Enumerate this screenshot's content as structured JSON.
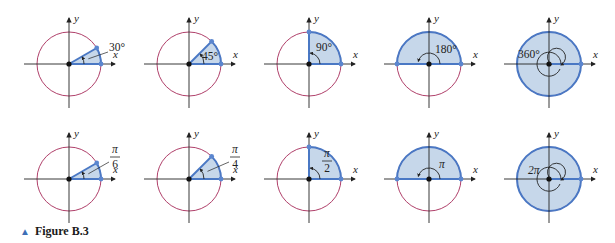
{
  "figure": {
    "caption_marker": "▲",
    "caption": "Figure B.3",
    "colors": {
      "circle": "#b0406a",
      "axis": "#222222",
      "ray": "#4a78c4",
      "fill": "#c6d7ea",
      "point": "#5b86cf",
      "label": "#222222"
    },
    "axis_labels": {
      "x": "x",
      "y": "y"
    },
    "rows": [
      {
        "unit": "degrees",
        "panels": [
          {
            "angle_deg": 30,
            "label": "30°"
          },
          {
            "angle_deg": 45,
            "label": "45°"
          },
          {
            "angle_deg": 90,
            "label": "90°"
          },
          {
            "angle_deg": 180,
            "label": "180°"
          },
          {
            "angle_deg": 360,
            "label": "360°"
          }
        ]
      },
      {
        "unit": "radians",
        "panels": [
          {
            "angle_deg": 30,
            "label_num": "π",
            "label_den": "6"
          },
          {
            "angle_deg": 45,
            "label_num": "π",
            "label_den": "4"
          },
          {
            "angle_deg": 90,
            "label_num": "π",
            "label_den": "2"
          },
          {
            "angle_deg": 180,
            "label": "π"
          },
          {
            "angle_deg": 360,
            "label": "2π"
          }
        ]
      }
    ]
  }
}
